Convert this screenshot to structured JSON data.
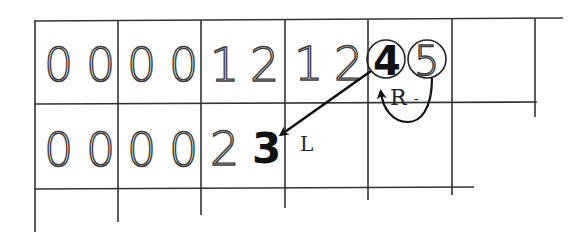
{
  "diagram": {
    "title": "",
    "grid": {
      "rows": 2,
      "columns": 6,
      "row_1_cells": [
        {
          "digits": [
            "0",
            "0"
          ]
        },
        {
          "digits": [
            "0",
            "0"
          ]
        },
        {
          "digits": [
            "1",
            "2"
          ]
        },
        {
          "digits": [
            "1",
            "2"
          ]
        },
        {
          "digits": [
            "4",
            "5"
          ],
          "circled": true,
          "highlight": "4"
        },
        {
          "digits": []
        }
      ],
      "row_2_cells": [
        {
          "digits": [
            "0",
            "0"
          ]
        },
        {
          "digits": [
            "0",
            "0"
          ]
        },
        {
          "digits": [
            "2",
            "3"
          ],
          "highlight": "3"
        },
        {
          "digits": []
        },
        {
          "digits": []
        },
        {
          "digits": []
        }
      ]
    },
    "row1": {
      "c1a": "0",
      "c1b": "0",
      "c2a": "0",
      "c2b": "0",
      "c3a": "1",
      "c3b": "2",
      "c4a": "1",
      "c4b": "2",
      "c5a": "4",
      "c5b": "5"
    },
    "row2": {
      "c1a": "0",
      "c1b": "0",
      "c2a": "0",
      "c2b": "0",
      "c3a": "2",
      "c3b": "3"
    },
    "arrows": [
      {
        "from": "4 (row 1)",
        "to": "3 (row 2)",
        "label": "L"
      },
      {
        "from": "5 (row 1)",
        "to": "4 (row 1)",
        "label": "R",
        "shape": "curved loop"
      }
    ],
    "labels": {
      "left_arrow": "L",
      "right_arrow": "R",
      "right_dash": "-"
    },
    "colors": {
      "ink": "#222222",
      "background": "#ffffff"
    }
  }
}
